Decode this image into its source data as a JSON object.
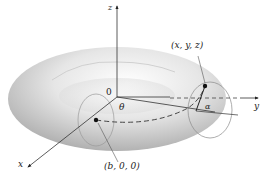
{
  "figure": {
    "type": "torus-coordinate-diagram",
    "labels": {
      "z_axis": "z",
      "y_axis": "y",
      "x_axis": "x",
      "origin": "0",
      "theta": "θ",
      "alpha": "α",
      "point_xyz": "(x, y, z)",
      "point_b00": "(b, 0, 0)"
    },
    "colors": {
      "torus_light": "#f4f4f4",
      "torus_dark": "#9a9a9a",
      "axis": "#333333",
      "background": "#ffffff"
    }
  }
}
